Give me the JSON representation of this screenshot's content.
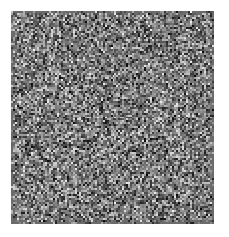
{
  "page": {
    "width": 229,
    "height": 237,
    "background_color": "#ffffff",
    "content_type": "grayscale-random-noise-texture"
  },
  "noise_block": {
    "label": "random grayscale dither noise patch",
    "x": 11,
    "y": 11,
    "width": 203,
    "height": 213,
    "cell_size": 2,
    "mean_gray": "#6b6b6b",
    "min_gray": "#000000",
    "max_gray": "#ffffff",
    "edge_feather_px": 3,
    "colorized": false,
    "seed": 20240517
  }
}
